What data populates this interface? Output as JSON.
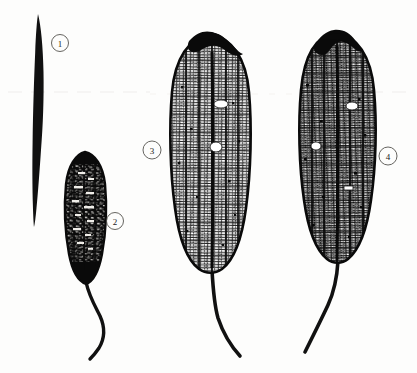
{
  "plate": {
    "title": "Botanical line illustration plate of four elongated spike and cob specimens",
    "background_color": "#fdfdfc",
    "ink_color": "#111111",
    "label_circle_color": "#55544f",
    "width": 417,
    "height": 373
  },
  "figures": [
    {
      "id": "figure-1",
      "number": "1",
      "description": "Slender dark spike, solid black, tapering to a fine point at the bottom",
      "label": {
        "cx": 60,
        "cy": 43,
        "r": 8.5
      },
      "body": {
        "x": 30,
        "y": 14,
        "width": 14,
        "height": 213
      },
      "fill_style": "solid-black",
      "has_stalk": false
    },
    {
      "id": "figure-2",
      "number": "2",
      "description": "Short dark cob, densely black with small pale kernel specks, long curved stalk",
      "label": {
        "cx": 115,
        "cy": 221,
        "r": 8.5
      },
      "body": {
        "x": 66,
        "y": 152,
        "width": 40,
        "height": 132
      },
      "fill_style": "dark-kernels",
      "has_stalk": true,
      "stalk_end": {
        "x": 90,
        "y": 358
      }
    },
    {
      "id": "figure-3",
      "number": "3",
      "description": "Large pale cob with fine dark reticulate kernel grid, dark crown cap at apex, long curved stalk",
      "label": {
        "cx": 152,
        "cy": 150,
        "r": 9
      },
      "body": {
        "x": 170,
        "y": 32,
        "width": 80,
        "height": 240
      },
      "fill_style": "light-grid",
      "has_stalk": true,
      "has_dark_cap": true,
      "stalk_end": {
        "x": 240,
        "y": 356
      }
    },
    {
      "id": "figure-4",
      "number": "4",
      "description": "Large cob with denser dark reticulate kernel grid, dark irregular cap at apex, long stalk curving left",
      "label": {
        "cx": 388,
        "cy": 156,
        "r": 9
      },
      "body": {
        "x": 297,
        "y": 30,
        "width": 78,
        "height": 232
      },
      "fill_style": "dark-grid",
      "has_stalk": true,
      "has_dark_cap": true,
      "stalk_end": {
        "x": 305,
        "y": 352
      }
    }
  ],
  "artifacts": {
    "scan_line_label": "faint horizontal scan line",
    "scan_line_y": 92,
    "scan_line_color": "#ebe9e4"
  }
}
